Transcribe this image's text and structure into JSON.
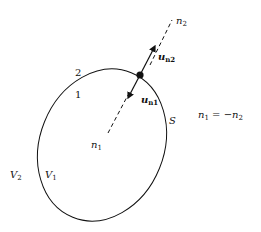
{
  "diagram": {
    "labels": {
      "n2": {
        "main": "n",
        "sub": "2"
      },
      "un2": {
        "main": "u",
        "sub": "n2"
      },
      "un1": {
        "main": "u",
        "sub": "n1"
      },
      "region2": "2",
      "region1": "1",
      "surface": "S",
      "n1": {
        "main": "n",
        "sub": "1"
      },
      "V2": {
        "main": "V",
        "sub": "2"
      },
      "V1": {
        "main": "V",
        "sub": "1"
      },
      "relation": {
        "lhs": "n",
        "lhs_sub": "1",
        "eq": " = −",
        "rhs": "n",
        "rhs_sub": "2"
      }
    },
    "colors": {
      "stroke": "#111111",
      "background": "#ffffff"
    }
  }
}
